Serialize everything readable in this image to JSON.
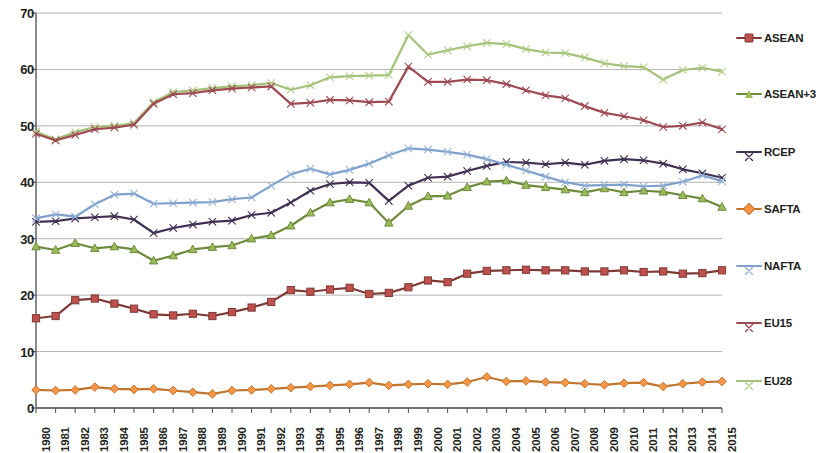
{
  "chart_data": {
    "type": "line",
    "title": "",
    "subtitle": "",
    "xlabel": "",
    "ylabel": "",
    "xlim": [
      1980,
      2015
    ],
    "ylim": [
      0,
      70
    ],
    "ytick_step": 10,
    "yticks": [
      "70",
      "60",
      "50",
      "40",
      "30",
      "20",
      "10",
      "0"
    ],
    "grid": true,
    "grid_axis": "y",
    "legend_position": "right",
    "x": [
      "1980",
      "1981",
      "1982",
      "1983",
      "1984",
      "1985",
      "1986",
      "1987",
      "1988",
      "1989",
      "1990",
      "1991",
      "1992",
      "1993",
      "1994",
      "1995",
      "1996",
      "1997",
      "1998",
      "1999",
      "2000",
      "2001",
      "2002",
      "2003",
      "2004",
      "2005",
      "2006",
      "2007",
      "2008",
      "2009",
      "2010",
      "2011",
      "2012",
      "2013",
      "2014",
      "2015"
    ],
    "series": [
      {
        "name": "ASEAN",
        "color": "#C0504D",
        "line_color": "#7C3B36",
        "marker": "square",
        "values": [
          15.9,
          16.3,
          19.1,
          19.4,
          18.5,
          17.6,
          16.6,
          16.4,
          16.7,
          16.3,
          17.0,
          17.8,
          18.8,
          20.9,
          20.6,
          21.0,
          21.3,
          20.2,
          20.4,
          21.4,
          22.6,
          22.3,
          23.8,
          24.3,
          24.4,
          24.5,
          24.4,
          24.4,
          24.2,
          24.2,
          24.4,
          24.1,
          24.2,
          23.8,
          23.9,
          24.4
        ]
      },
      {
        "name": "ASEAN+3",
        "color": "#9BBB59",
        "line_color": "#6E8B3D",
        "marker": "triangle",
        "values": [
          28.6,
          28.0,
          29.2,
          28.3,
          28.6,
          28.1,
          26.1,
          27.0,
          28.1,
          28.5,
          28.8,
          30.0,
          30.6,
          32.3,
          34.6,
          36.4,
          37.0,
          36.4,
          32.8,
          35.8,
          37.5,
          37.6,
          39.1,
          40.1,
          40.3,
          39.5,
          39.1,
          38.7,
          38.2,
          38.9,
          38.2,
          38.5,
          38.3,
          37.7,
          37.1,
          35.6
        ]
      },
      {
        "name": "RCEP",
        "color": "#403152",
        "line_color": "#403152",
        "marker": "x",
        "values": [
          33.0,
          33.1,
          33.6,
          33.8,
          34.0,
          33.4,
          31.0,
          31.9,
          32.5,
          33.0,
          33.2,
          34.2,
          34.6,
          36.4,
          38.5,
          39.7,
          40.0,
          39.9,
          36.7,
          39.4,
          40.8,
          41.0,
          42.0,
          42.9,
          43.6,
          43.5,
          43.2,
          43.5,
          43.1,
          43.8,
          44.1,
          43.9,
          43.3,
          42.3,
          41.6,
          40.8
        ]
      },
      {
        "name": "SAFTA",
        "color": "#F79646",
        "line_color": "#C0752E",
        "marker": "diamond",
        "values": [
          3.2,
          3.1,
          3.2,
          3.7,
          3.4,
          3.3,
          3.4,
          3.1,
          2.8,
          2.5,
          3.1,
          3.2,
          3.4,
          3.6,
          3.8,
          4.0,
          4.2,
          4.5,
          4.0,
          4.2,
          4.3,
          4.2,
          4.6,
          5.5,
          4.7,
          4.8,
          4.6,
          4.5,
          4.3,
          4.1,
          4.4,
          4.5,
          3.8,
          4.3,
          4.6,
          4.7
        ]
      },
      {
        "name": "NAFTA",
        "color": "#95B3D7",
        "line_color": "#7FA1CB",
        "marker": "x",
        "values": [
          33.6,
          34.3,
          33.9,
          36.1,
          37.8,
          38.0,
          36.2,
          36.3,
          36.4,
          36.5,
          37.0,
          37.3,
          39.4,
          41.4,
          42.4,
          41.4,
          42.2,
          43.3,
          44.8,
          46.0,
          45.8,
          45.4,
          44.9,
          44.1,
          43.1,
          42.1,
          41.0,
          40.0,
          39.4,
          39.5,
          39.6,
          39.3,
          39.4,
          40.1,
          41.2,
          40.2
        ]
      },
      {
        "name": "EU15",
        "color": "#9E4A52",
        "line_color": "#9E4A52",
        "marker": "x",
        "values": [
          48.6,
          47.4,
          48.4,
          49.4,
          49.7,
          50.2,
          53.9,
          55.6,
          55.8,
          56.3,
          56.6,
          56.8,
          57.0,
          53.9,
          54.1,
          54.6,
          54.5,
          54.2,
          54.3,
          60.5,
          57.8,
          57.8,
          58.2,
          58.1,
          57.4,
          56.3,
          55.4,
          54.9,
          53.5,
          52.3,
          51.7,
          51.0,
          49.8,
          50.0,
          50.6,
          49.4
        ]
      },
      {
        "name": "EU28",
        "color": "#B0CE88",
        "line_color": "#A3C177",
        "marker": "x",
        "values": [
          49.0,
          47.6,
          48.9,
          49.8,
          50.0,
          50.5,
          54.2,
          56.0,
          56.3,
          56.7,
          57.0,
          57.2,
          57.6,
          56.4,
          57.2,
          58.6,
          58.8,
          58.9,
          59.0,
          66.1,
          62.6,
          63.4,
          64.1,
          64.7,
          64.5,
          63.6,
          63.0,
          62.9,
          62.1,
          61.1,
          60.6,
          60.4,
          58.2,
          59.9,
          60.3,
          59.6
        ]
      }
    ]
  },
  "legend": {
    "items": [
      {
        "label": "ASEAN",
        "y": 38,
        "color": "#C0504D",
        "line_color": "#7C3B36",
        "marker": "square"
      },
      {
        "label": "ASEAN+3",
        "y": 94,
        "color": "#9BBB59",
        "line_color": "#6E8B3D",
        "marker": "triangle"
      },
      {
        "label": "RCEP",
        "y": 152,
        "color": "#403152",
        "line_color": "#403152",
        "marker": "x"
      },
      {
        "label": "SAFTA",
        "y": 209,
        "color": "#F79646",
        "line_color": "#C0752E",
        "marker": "diamond"
      },
      {
        "label": "NAFTA",
        "y": 266,
        "color": "#95B3D7",
        "line_color": "#7FA1CB",
        "marker": "x"
      },
      {
        "label": "EU15",
        "y": 323,
        "color": "#9E4A52",
        "line_color": "#9E4A52",
        "marker": "x"
      },
      {
        "label": "EU28",
        "y": 381,
        "color": "#B0CE88",
        "line_color": "#A3C177",
        "marker": "x"
      }
    ]
  },
  "axes": {
    "y_axis_name": "value-axis",
    "x_axis_name": "year-axis",
    "gridline_color": "#808080",
    "axis_color": "#595959"
  }
}
